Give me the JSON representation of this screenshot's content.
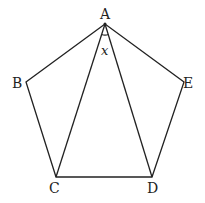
{
  "diagram": {
    "stroke_color": "#222222",
    "background": "#ffffff",
    "vertices": [
      {
        "name": "A",
        "x": 105,
        "y": 24
      },
      {
        "name": "B",
        "x": 26,
        "y": 82
      },
      {
        "name": "C",
        "x": 56,
        "y": 177
      },
      {
        "name": "D",
        "x": 152,
        "y": 177
      },
      {
        "name": "E",
        "x": 184,
        "y": 82
      }
    ],
    "labels": {
      "A": "A",
      "B": "B",
      "C": "C",
      "D": "D",
      "E": "E"
    },
    "angle": {
      "vertex": "A",
      "between": [
        "AC",
        "AD"
      ],
      "label": "x"
    },
    "segments": [
      "AB",
      "BC",
      "CD",
      "DE",
      "EA",
      "AC",
      "AD"
    ]
  }
}
